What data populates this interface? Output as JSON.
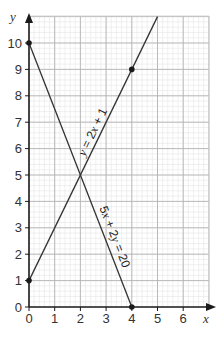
{
  "chart_data": {
    "type": "line",
    "title": "",
    "xlabel": "x",
    "ylabel": "y",
    "xlim": [
      0,
      7
    ],
    "ylim": [
      0,
      11
    ],
    "x_ticks": [
      0,
      1,
      2,
      3,
      4,
      5,
      6
    ],
    "y_ticks": [
      0,
      1,
      2,
      3,
      4,
      5,
      6,
      7,
      8,
      9,
      10
    ],
    "grid": true,
    "minor_grid_step": 0.2,
    "series": [
      {
        "name": "y = 2x + 1",
        "label_parts": [
          "y",
          " = 2",
          "x",
          " + 1"
        ],
        "equation": {
          "slope": 2,
          "intercept": 1
        },
        "x_range": [
          0,
          5
        ],
        "marked_points": [
          [
            0,
            1
          ],
          [
            4,
            9
          ]
        ],
        "color": "#333333"
      },
      {
        "name": "5x + 2y = 20",
        "label_parts": [
          "5",
          "x",
          " + 2",
          "y",
          " = 20"
        ],
        "equation": {
          "slope": -2.5,
          "intercept": 10
        },
        "x_range": [
          0,
          4
        ],
        "marked_points": [
          [
            0,
            10
          ],
          [
            4,
            0
          ]
        ],
        "color": "#333333"
      }
    ]
  }
}
